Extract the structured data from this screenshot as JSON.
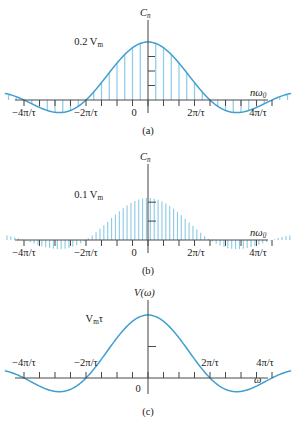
{
  "figure": {
    "name": "fourier-spectra-figure",
    "curve_color": "#3f9fd0",
    "line_color": "#8fcbe6",
    "axis_color": "#4a4a4a",
    "background": "#ffffff"
  },
  "panels": [
    {
      "id": "a",
      "caption": "(a)",
      "y_axis_label": "C",
      "y_axis_label_sub": "n",
      "x_axis_label": "nω",
      "x_axis_label_sub": "0",
      "peak_label": "0.2 V",
      "peak_label_sub": "m",
      "origin_label": "0",
      "y_ticks": 3,
      "x_tick_labels": [
        "−4π/τ",
        "−2π/τ",
        "0",
        "2π/τ",
        "4π/τ"
      ],
      "x_tick_values": [
        -4,
        -2,
        0,
        2,
        4
      ],
      "line_spacing": 0.25,
      "n_lines": 33
    },
    {
      "id": "b",
      "caption": "(b)",
      "y_axis_label": "C",
      "y_axis_label_sub": "n",
      "x_axis_label": "nω",
      "x_axis_label_sub": "0",
      "peak_label": "0.1 V",
      "peak_label_sub": "m",
      "origin_label": "0",
      "y_ticks": 2,
      "x_tick_labels": [
        "−4π/τ",
        "−2π/τ",
        "0",
        "2π/τ",
        "4π/τ"
      ],
      "x_tick_values": [
        -4,
        -2,
        0,
        2,
        4
      ],
      "line_spacing": 0.125,
      "n_lines": 65
    },
    {
      "id": "c",
      "caption": "(c)",
      "y_axis_label": "V(ω)",
      "y_axis_label_sub": "",
      "x_axis_label": "ω",
      "x_axis_label_sub": "",
      "peak_label": "V",
      "peak_label_sub": "m",
      "peak_label_tail": "τ",
      "origin_label": "0",
      "y_ticks": 1,
      "x_tick_labels": [
        "−4π/τ",
        "−2π/τ",
        "2π/τ",
        "4π/τ"
      ],
      "x_tick_values": [
        -4,
        -2,
        2,
        4
      ]
    }
  ],
  "chart_data": {
    "type": "line",
    "title": "",
    "subtitle": "",
    "envelope_function": "sinc(x) = sin(pi*x/2)/(pi*x/2) with x in units of 2pi/tau",
    "xlabel": "nω₀ / ω",
    "ylabel": "Cₙ / V(ω)",
    "xlim": [
      -4.6,
      4.6
    ],
    "xtick_values": [
      -4,
      -3.5,
      -3,
      -2.5,
      -2,
      -1.5,
      -1,
      -0.5,
      0,
      0.5,
      1,
      1.5,
      2,
      2.5,
      3,
      3.5,
      4
    ],
    "grid": false,
    "legend": "none",
    "zero_crossings": [
      -4,
      -2,
      2,
      4
    ],
    "series": [
      {
        "name": "panel-a-envelope",
        "panel": "a",
        "peak_value": 0.2,
        "peak_unit": "Vm",
        "x": [
          -4.6,
          -4.0,
          -3.0,
          -2.0,
          -1.0,
          0.0,
          1.0,
          2.0,
          3.0,
          4.0,
          4.6
        ],
        "values": [
          0.026,
          0.0,
          -0.042,
          0.0,
          0.127,
          0.2,
          0.127,
          0.0,
          -0.042,
          0.0,
          0.026
        ]
      },
      {
        "name": "panel-a-lines",
        "panel": "a",
        "type": "stem",
        "spacing": 0.25,
        "peak_value": 0.2
      },
      {
        "name": "panel-b-envelope",
        "panel": "b",
        "peak_value": 0.1,
        "peak_unit": "Vm",
        "x": [
          -4.6,
          -4.0,
          -3.0,
          -2.0,
          -1.0,
          0.0,
          1.0,
          2.0,
          3.0,
          4.0,
          4.6
        ],
        "values": [
          0.013,
          0.0,
          -0.021,
          0.0,
          0.0637,
          0.1,
          0.0637,
          0.0,
          -0.021,
          0.0,
          0.013
        ]
      },
      {
        "name": "panel-b-lines",
        "panel": "b",
        "type": "stem",
        "spacing": 0.125,
        "peak_value": 0.1
      },
      {
        "name": "panel-c-transform",
        "panel": "c",
        "peak_value": 1.0,
        "peak_unit": "Vmτ",
        "x": [
          -4.6,
          -4.0,
          -3.0,
          -2.0,
          -1.0,
          0.0,
          1.0,
          2.0,
          3.0,
          4.0,
          4.6
        ],
        "values": [
          0.13,
          0.0,
          -0.212,
          0.0,
          0.637,
          1.0,
          0.637,
          0.0,
          -0.212,
          0.0,
          0.13
        ]
      }
    ]
  }
}
